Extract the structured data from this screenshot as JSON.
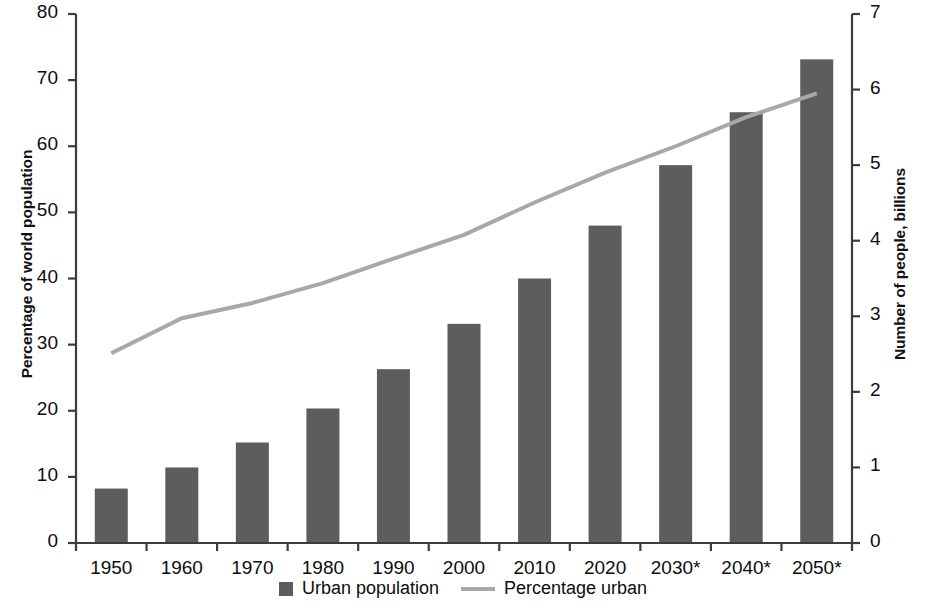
{
  "chart_data": {
    "type": "bar",
    "title": "",
    "subtitle": "",
    "categories": [
      "1950",
      "1960",
      "1970",
      "1980",
      "1990",
      "2000",
      "2010",
      "2020",
      "2030*",
      "2040*",
      "2050*"
    ],
    "xlabel": "",
    "grid": false,
    "legend_position": "bottom",
    "series": [
      {
        "name": "Urban population",
        "type": "bar",
        "axis": "right",
        "unit": "billions",
        "color": "#5d5d5d",
        "values": [
          0.72,
          1.0,
          1.33,
          1.78,
          2.3,
          2.9,
          3.5,
          4.2,
          5.0,
          5.7,
          6.4
        ]
      },
      {
        "name": "Percentage urban",
        "type": "line",
        "axis": "left",
        "unit": "percent",
        "color": "#a8a8a8",
        "values": [
          28.7,
          34.0,
          36.3,
          39.3,
          43.0,
          46.6,
          51.5,
          56.0,
          60.0,
          64.4,
          68.0
        ]
      }
    ],
    "left_axis": {
      "label": "Percentage of world population",
      "ylim": [
        0,
        80
      ],
      "ticks": [
        0,
        10,
        20,
        30,
        40,
        50,
        60,
        70,
        80
      ],
      "tick_labels": [
        "0",
        "10",
        "20",
        "30",
        "40",
        "50",
        "60",
        "70",
        "80"
      ]
    },
    "right_axis": {
      "label": "Number of people, billions",
      "ylim": [
        0,
        7
      ],
      "ticks": [
        0,
        1,
        2,
        3,
        4,
        5,
        6,
        7
      ],
      "tick_labels": [
        "0",
        "1",
        "2",
        "3",
        "4",
        "5",
        "6",
        "7"
      ]
    },
    "legend": [
      {
        "label": "Urban population",
        "marker": "square",
        "color": "#5d5d5d"
      },
      {
        "label": "Percentage urban",
        "marker": "line",
        "color": "#a8a8a8"
      }
    ],
    "colors": {
      "bar": "#5d5d5d",
      "line": "#a8a8a8",
      "axis": "#3c3c3c",
      "text": "#0d0d0d",
      "background": "#ffffff"
    }
  }
}
